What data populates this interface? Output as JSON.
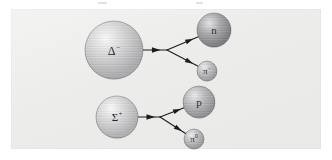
{
  "figure": {
    "kind": "particle-decay-diagram",
    "panel": {
      "background_color": "#ececea",
      "border_color": "#e2e2e0"
    },
    "scan_artifacts": [
      {
        "x": 98,
        "y": 2,
        "width": 9
      },
      {
        "x": 196,
        "y": 2,
        "width": 7
      }
    ]
  },
  "decays": [
    {
      "id": "delta-decay",
      "name": "delta-minus-decay",
      "parent": {
        "name": "delta-minus",
        "symbol": "Δ",
        "superscript": "−",
        "label": "Δ−",
        "cx": 114,
        "cy": 50,
        "r": 29,
        "shade_light": "#fbfbfb",
        "shade_mid": "#d3d3d3",
        "shade_dark": "#a9a9ab",
        "label_size": "label-big"
      },
      "products": [
        {
          "name": "neutron",
          "symbol": "n",
          "superscript": "",
          "label": "n",
          "cx": 214,
          "cy": 30,
          "r": 17,
          "shade_light": "#e6e6e6",
          "shade_mid": "#a5a5a7",
          "shade_dark": "#77777a",
          "label_size": "label-med"
        },
        {
          "name": "pion-minus",
          "symbol": "π",
          "superscript": "−",
          "label": "π−",
          "cx": 207,
          "cy": 71,
          "r": 10,
          "shade_light": "#efefef",
          "shade_mid": "#c0c0c2",
          "shade_dark": "#98989b",
          "label_size": "label-small"
        }
      ],
      "vertex": {
        "x": 167,
        "y": 50
      },
      "incoming_arrow": {
        "x1": 143,
        "y1": 50,
        "x2": 167,
        "y2": 50,
        "head_at": 0.55
      }
    },
    {
      "id": "sigma-decay",
      "name": "sigma-plus-decay",
      "parent": {
        "name": "sigma-plus",
        "symbol": "Σ",
        "superscript": "+",
        "label": "Σ+",
        "cx": 117,
        "cy": 117,
        "r": 21,
        "shade_light": "#fbfbfb",
        "shade_mid": "#d6d6d6",
        "shade_dark": "#aeaeb0",
        "label_size": "label-med"
      },
      "products": [
        {
          "name": "proton",
          "symbol": "p",
          "superscript": "",
          "label": "p",
          "cx": 199,
          "cy": 102,
          "r": 16,
          "shade_light": "#ebebeb",
          "shade_mid": "#b6b6b8",
          "shade_dark": "#8c8c8f",
          "label_size": "label-med"
        },
        {
          "name": "pion-zero",
          "symbol": "π",
          "superscript": "0",
          "label": "π0",
          "cx": 194,
          "cy": 139,
          "r": 10,
          "shade_light": "#efefef",
          "shade_mid": "#bfbfc1",
          "shade_dark": "#97979a",
          "label_size": "label-small"
        }
      ],
      "vertex": {
        "x": 160,
        "y": 117
      },
      "incoming_arrow": {
        "x1": 138,
        "y1": 117,
        "x2": 160,
        "y2": 117,
        "head_at": 0.58
      }
    }
  ],
  "style": {
    "line_color": "#1c1c1e",
    "line_width": 1.1,
    "text_color": "#24242a"
  }
}
